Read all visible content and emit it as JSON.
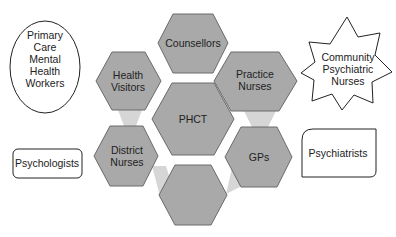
{
  "diagram": {
    "center": {
      "label": "PHCT"
    },
    "hexagons": [
      {
        "id": "counsellors",
        "lines": [
          "Counsellors"
        ]
      },
      {
        "id": "health-visitors",
        "lines": [
          "Health",
          "Visitors"
        ]
      },
      {
        "id": "practice-nurses",
        "lines": [
          "Practice",
          "Nurses"
        ]
      },
      {
        "id": "district-nurses",
        "lines": [
          "District",
          "Nurses"
        ]
      },
      {
        "id": "gps",
        "lines": [
          "GPs"
        ]
      },
      {
        "id": "blank",
        "lines": []
      }
    ],
    "outside": {
      "ellipse": {
        "lines": [
          "Primary",
          "Care",
          "Mental",
          "Health",
          "Workers"
        ]
      },
      "star": {
        "lines": [
          "Community",
          "Psychiatric",
          "Nurses"
        ]
      },
      "left_box": {
        "label": "Psychologists"
      },
      "right_box": {
        "label": "Psychiatrists"
      }
    },
    "colors": {
      "hex_fill": "#a9a9a9",
      "hex_stroke": "#6a6a6a",
      "connector": "#d6d6d6",
      "outline": "#222222"
    }
  }
}
